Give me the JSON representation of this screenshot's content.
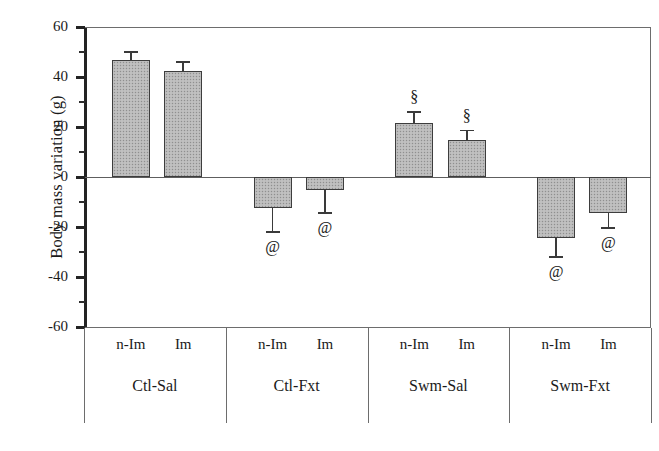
{
  "chart_data": {
    "type": "bar",
    "title": "",
    "xlabel": "",
    "ylabel": "Body mass variation (g)",
    "ylim": [
      -60,
      60
    ],
    "ytick_values": [
      60,
      40,
      20,
      0,
      -20,
      -40,
      -60
    ],
    "ytick_labels": [
      "60",
      "40",
      "20",
      "0",
      "-20",
      "-40",
      "-60"
    ],
    "minor_tick_values": [
      50,
      30,
      10,
      -10,
      -30,
      -50
    ],
    "grid": false,
    "legend": "none",
    "groups": [
      "Ctl-Sal",
      "Ctl-Fxt",
      "Swm-Sal",
      "Swm-Fxt"
    ],
    "subcategories": [
      "n-Im",
      "Im"
    ],
    "categories": [
      "Ctl-Sal n-Im",
      "Ctl-Sal Im",
      "Ctl-Fxt n-Im",
      "Ctl-Fxt Im",
      "Swm-Sal n-Im",
      "Swm-Sal Im",
      "Swm-Fxt n-Im",
      "Swm-Fxt Im"
    ],
    "values": [
      47,
      42.5,
      -12.5,
      -5,
      21.5,
      15,
      -24.5,
      -14.5
    ],
    "errors": [
      3.5,
      4,
      9,
      9,
      5,
      4,
      7,
      5.5
    ],
    "annotations": [
      "",
      "",
      "@",
      "@",
      "§",
      "§",
      "@",
      "@"
    ],
    "bar_color": "#b9b9b9",
    "bar_edge_color": "#3d3d3d",
    "axis_color": "#232323"
  },
  "axis": {
    "y_title": "Body mass variation (g)",
    "ticks": [
      {
        "label": "60",
        "value": 60
      },
      {
        "label": "40",
        "value": 40
      },
      {
        "label": "20",
        "value": 20
      },
      {
        "label": "0",
        "value": 0
      },
      {
        "label": "-20",
        "value": -20
      },
      {
        "label": "-40",
        "value": -40
      },
      {
        "label": "-60",
        "value": -60
      }
    ]
  },
  "bars": [
    {
      "sub": "n-Im",
      "group": "Ctl-Sal",
      "value": 47,
      "error": 3.5,
      "mark": ""
    },
    {
      "sub": "Im",
      "group": "Ctl-Sal",
      "value": 42.5,
      "error": 4,
      "mark": ""
    },
    {
      "sub": "n-Im",
      "group": "Ctl-Fxt",
      "value": -12.5,
      "error": 9,
      "mark": "@"
    },
    {
      "sub": "Im",
      "group": "Ctl-Fxt",
      "value": -5,
      "error": 9,
      "mark": "@"
    },
    {
      "sub": "n-Im",
      "group": "Swm-Sal",
      "value": 21.5,
      "error": 5,
      "mark": "§"
    },
    {
      "sub": "Im",
      "group": "Swm-Sal",
      "value": 15,
      "error": 4,
      "mark": "§"
    },
    {
      "sub": "n-Im",
      "group": "Swm-Fxt",
      "value": -24.5,
      "error": 7,
      "mark": "@"
    },
    {
      "sub": "Im",
      "group": "Swm-Fxt",
      "value": -14.5,
      "error": 5.5,
      "mark": "@"
    }
  ],
  "groups": [
    {
      "label": "Ctl-Sal"
    },
    {
      "label": "Ctl-Fxt"
    },
    {
      "label": "Swm-Sal"
    },
    {
      "label": "Swm-Fxt"
    }
  ]
}
